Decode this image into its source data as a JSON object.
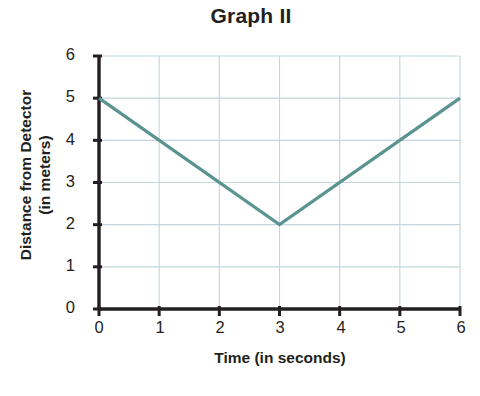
{
  "chart_data": {
    "type": "line",
    "title": "Graph II",
    "xlabel": "Time (in seconds)",
    "ylabel": "Distance from Detector",
    "ylabel_line1": "Distance from Detector",
    "ylabel_line2": "(in meters)",
    "xlim": [
      0,
      6
    ],
    "ylim": [
      0,
      6
    ],
    "xticks": [
      "0",
      "1",
      "2",
      "3",
      "4",
      "5",
      "6"
    ],
    "yticks": [
      "0",
      "1",
      "2",
      "3",
      "4",
      "5",
      "6"
    ],
    "grid": true,
    "legend": null,
    "series": [
      {
        "name": "Distance from Detector",
        "x": [
          0,
          3,
          6
        ],
        "values": [
          5,
          2,
          5
        ],
        "color": "#5a9490"
      }
    ],
    "colors": {
      "line": "#5a9490",
      "grid": "#c3d5dd",
      "axis": "#231f20",
      "text": "#231f20",
      "background": "#ffffff"
    }
  }
}
